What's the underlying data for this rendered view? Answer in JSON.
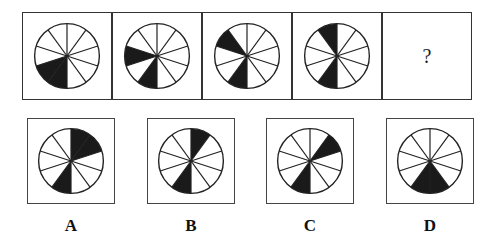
{
  "puzzle": {
    "sectors_per_circle": 10,
    "fill_color": "#1a1a1a",
    "line_color": "#222222",
    "sequence": [
      {
        "filled_sectors": [
          5,
          6
        ]
      },
      {
        "filled_sectors": [
          5,
          7
        ]
      },
      {
        "filled_sectors": [
          5,
          8
        ]
      },
      {
        "filled_sectors": [
          5,
          9
        ]
      }
    ],
    "question_mark": "?"
  },
  "options": [
    {
      "label": "A",
      "filled_sectors": [
        0,
        1,
        5
      ]
    },
    {
      "label": "B",
      "filled_sectors": [
        0,
        5
      ]
    },
    {
      "label": "C",
      "filled_sectors": [
        1,
        5
      ]
    },
    {
      "label": "D",
      "filled_sectors": [
        4,
        5
      ]
    }
  ]
}
